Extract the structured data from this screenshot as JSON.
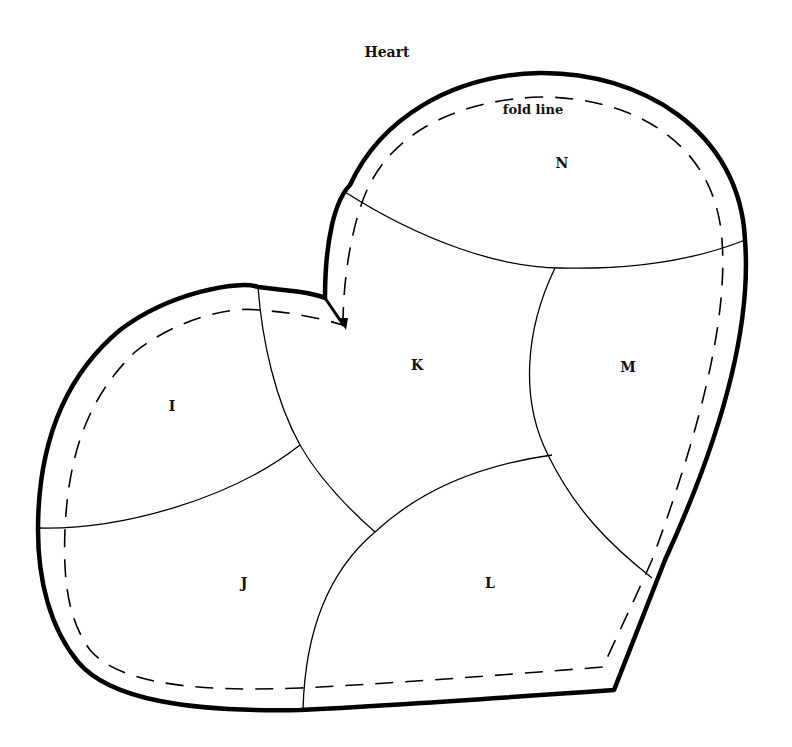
{
  "diagram": {
    "title": "Heart",
    "fold_label": "fold line",
    "pieces": [
      {
        "id": "I",
        "label": "I"
      },
      {
        "id": "J",
        "label": "J"
      },
      {
        "id": "K",
        "label": "K"
      },
      {
        "id": "L",
        "label": "L"
      },
      {
        "id": "M",
        "label": "M"
      },
      {
        "id": "N",
        "label": "N"
      }
    ],
    "colors": {
      "line": "#000000",
      "background": "#ffffff"
    }
  }
}
